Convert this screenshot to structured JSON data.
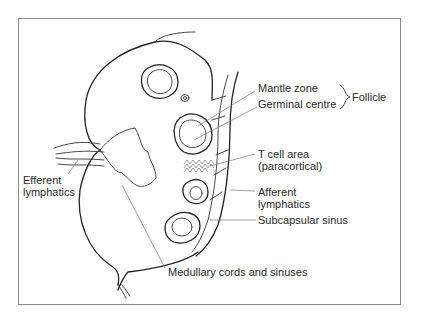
{
  "figure": {
    "labels": {
      "mantle_zone": "Mantle zone",
      "germinal_centre": "Germinal centre",
      "follicle": "Follicle",
      "t_cell_area_line1": "T cell area",
      "t_cell_area_line2": "(paracortical)",
      "afferent_line1": "Afferent",
      "afferent_line2": "lymphatics",
      "subcapsular_sinus": "Subcapsular sinus",
      "efferent_line1": "Efferent",
      "efferent_line2": "lymphatics",
      "medullary": "Medullary cords and sinuses"
    },
    "colors": {
      "line": "#222222",
      "leader": "#777777",
      "frame": "#8a8a8a",
      "text": "#2a2a2a"
    }
  }
}
